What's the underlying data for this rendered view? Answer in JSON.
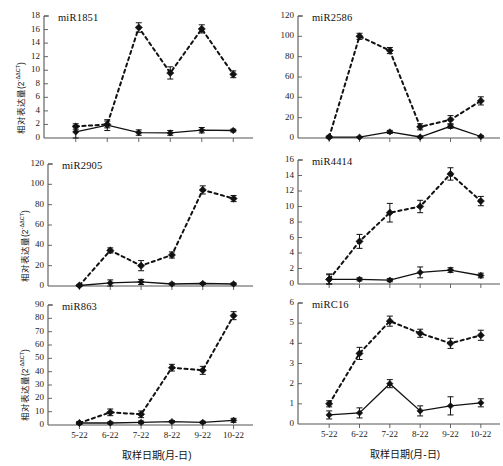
{
  "figure": {
    "width": 503,
    "height": 466,
    "background": "#ffffff",
    "ink": "#111111",
    "axis_color": "#555555"
  },
  "axes": {
    "xlabel": "取样日期(月-日)",
    "ylabel_prefix": "相对表达量(2",
    "ylabel_exponent": "-ΔΔCT",
    "ylabel_suffix": ")",
    "categories": [
      "5-22",
      "6-22",
      "7-22",
      "8-22",
      "9-22",
      "10-22"
    ]
  },
  "series_style": {
    "treated": {
      "name": "dashed-series",
      "line": "dashed",
      "marker": "diamond",
      "color": "#111111"
    },
    "control": {
      "name": "solid-series",
      "line": "solid",
      "marker": "diamond",
      "color": "#111111"
    }
  },
  "chart_data": [
    {
      "id": "miR1851",
      "type": "line",
      "title": "miR1851",
      "xlabel": "取样日期(月-日)",
      "ylabel": "相对表达量(2-ΔΔCT)",
      "categories": [
        "5-22",
        "6-22",
        "7-22",
        "8-22",
        "9-22",
        "10-22"
      ],
      "ylim": [
        0,
        18
      ],
      "yticks": [
        0,
        2,
        4,
        6,
        8,
        10,
        12,
        14,
        16,
        18
      ],
      "grid": false,
      "legend": "none",
      "series": [
        {
          "name": "dashed-series",
          "values": [
            1.7,
            2.0,
            16.3,
            9.6,
            16.1,
            9.4
          ],
          "errors": [
            0.4,
            0.5,
            0.7,
            0.9,
            0.6,
            0.5
          ]
        },
        {
          "name": "solid-series",
          "values": [
            0.9,
            1.9,
            0.8,
            0.75,
            1.15,
            1.1
          ],
          "errors": [
            0.9,
            0.8,
            0.4,
            0.35,
            0.4,
            0.2
          ]
        }
      ]
    },
    {
      "id": "miR2586",
      "type": "line",
      "title": "miR2586",
      "xlabel": "取样日期(月-日)",
      "ylabel": "相对表达量(2-ΔΔCT)",
      "categories": [
        "5-22",
        "6-22",
        "7-22",
        "8-22",
        "9-22",
        "10-22"
      ],
      "ylim": [
        0,
        120
      ],
      "yticks": [
        0,
        20,
        40,
        60,
        80,
        100,
        120
      ],
      "grid": false,
      "legend": "none",
      "series": [
        {
          "name": "dashed-series",
          "values": [
            1.0,
            100.0,
            86.0,
            11.0,
            18.0,
            36.5
          ],
          "errors": [
            1.0,
            3.0,
            3.0,
            3.0,
            4.0,
            4.0
          ]
        },
        {
          "name": "solid-series",
          "values": [
            0.8,
            0.8,
            6.0,
            1.0,
            11.5,
            1.5
          ],
          "errors": [
            0.5,
            0.5,
            1.5,
            0.8,
            2.0,
            0.8
          ]
        }
      ]
    },
    {
      "id": "miR2905",
      "type": "line",
      "title": "miR2905",
      "xlabel": "取样日期(月-日)",
      "ylabel": "相对表达量(2-ΔΔCT)",
      "categories": [
        "5-22",
        "6-22",
        "7-22",
        "8-22",
        "9-22",
        "10-22"
      ],
      "ylim": [
        0,
        120
      ],
      "yticks": [
        0,
        20,
        40,
        60,
        80,
        100,
        120
      ],
      "grid": false,
      "legend": "none",
      "series": [
        {
          "name": "dashed-series",
          "values": [
            0.5,
            35.0,
            20.0,
            30.5,
            94.5,
            86.0
          ],
          "errors": [
            0.5,
            2.5,
            5.0,
            3.0,
            4.0,
            3.0
          ]
        },
        {
          "name": "solid-series",
          "values": [
            0.5,
            3.0,
            4.0,
            2.0,
            2.5,
            2.0
          ],
          "errors": [
            0.4,
            3.0,
            2.5,
            1.0,
            1.0,
            1.0
          ]
        }
      ]
    },
    {
      "id": "miR4414",
      "type": "line",
      "title": "miR4414",
      "xlabel": "取样日期(月-日)",
      "ylabel": "相对表达量(2-ΔΔCT)",
      "categories": [
        "5-22",
        "6-22",
        "7-22",
        "8-22",
        "9-22",
        "10-22"
      ],
      "ylim": [
        0,
        16
      ],
      "yticks": [
        0,
        2,
        4,
        6,
        8,
        10,
        12,
        14,
        16
      ],
      "grid": false,
      "legend": "none",
      "series": [
        {
          "name": "dashed-series",
          "values": [
            0.6,
            5.5,
            9.2,
            10.0,
            14.2,
            10.7
          ],
          "errors": [
            0.7,
            0.9,
            1.2,
            0.8,
            0.8,
            0.6
          ]
        },
        {
          "name": "solid-series",
          "values": [
            0.6,
            0.6,
            0.5,
            1.5,
            1.8,
            1.1
          ],
          "errors": [
            0.6,
            0.2,
            0.2,
            0.7,
            0.3,
            0.3
          ]
        }
      ]
    },
    {
      "id": "miR863",
      "type": "line",
      "title": "miR863",
      "xlabel": "取样日期(月-日)",
      "ylabel": "相对表达量(2-ΔΔCT)",
      "categories": [
        "5-22",
        "6-22",
        "7-22",
        "8-22",
        "9-22",
        "10-22"
      ],
      "ylim": [
        0,
        90
      ],
      "yticks": [
        0,
        10,
        20,
        30,
        40,
        50,
        60,
        70,
        80,
        90
      ],
      "grid": false,
      "legend": "none",
      "series": [
        {
          "name": "dashed-series",
          "values": [
            1.5,
            9.5,
            8.0,
            43.0,
            41.0,
            82.0
          ],
          "errors": [
            1.0,
            2.5,
            2.5,
            2.5,
            3.0,
            3.0
          ]
        },
        {
          "name": "solid-series",
          "values": [
            1.5,
            1.5,
            2.0,
            2.5,
            2.0,
            3.5
          ],
          "errors": [
            1.0,
            0.8,
            1.0,
            0.8,
            0.8,
            1.5
          ]
        }
      ]
    },
    {
      "id": "miRC16",
      "type": "line",
      "title": "miRC16",
      "xlabel": "取样日期(月-日)",
      "ylabel": "相对表达量(2-ΔΔCT)",
      "categories": [
        "5-22",
        "6-22",
        "7-22",
        "8-22",
        "9-22",
        "10-22"
      ],
      "ylim": [
        0,
        6
      ],
      "yticks": [
        0,
        1,
        2,
        3,
        4,
        5,
        6
      ],
      "grid": false,
      "legend": "none",
      "series": [
        {
          "name": "dashed-series",
          "values": [
            1.0,
            3.5,
            5.1,
            4.5,
            4.0,
            4.4
          ],
          "errors": [
            0.15,
            0.3,
            0.25,
            0.2,
            0.25,
            0.25
          ]
        },
        {
          "name": "solid-series",
          "values": [
            0.45,
            0.55,
            2.0,
            0.65,
            0.9,
            1.05
          ],
          "errors": [
            0.2,
            0.25,
            0.2,
            0.25,
            0.45,
            0.2
          ]
        }
      ]
    }
  ]
}
